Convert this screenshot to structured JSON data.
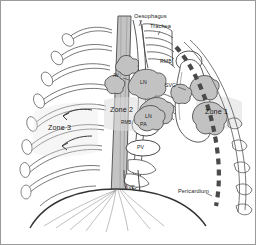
{
  "figure": {
    "type": "anatomical-diagram",
    "background_color": "#ffffff",
    "line_color": "#3a3a3a",
    "node_fill": "#c9c9c9",
    "vessel_fill": "#b5b5b5",
    "zone_fill": "#d8d8d8",
    "pericardium_color": "#4a4a4a"
  },
  "labels": {
    "oesophagus": "Oesophagus",
    "trachea": "Trachea",
    "rmb_upper": "RMB",
    "ln_upper": "LN",
    "svc": "SVC",
    "av": "AV",
    "zone1": "Zone 1",
    "zone2": "Zone 2",
    "zone3": "Zone 3",
    "rmb_lower": "RMB",
    "ln_lower": "LN",
    "pa": "PA",
    "pv": "PV",
    "ivc": "IVC",
    "pericardium": "Pericardium"
  },
  "legend_meanings": {
    "LN": "Lymph Node",
    "RMB": "Right Main Bronchus",
    "SVC": "Superior Vena Cava",
    "IVC": "Inferior Vena Cava",
    "PA": "Pulmonary Artery",
    "PV": "Pulmonary Vein",
    "AV": "Azygos Vein"
  }
}
